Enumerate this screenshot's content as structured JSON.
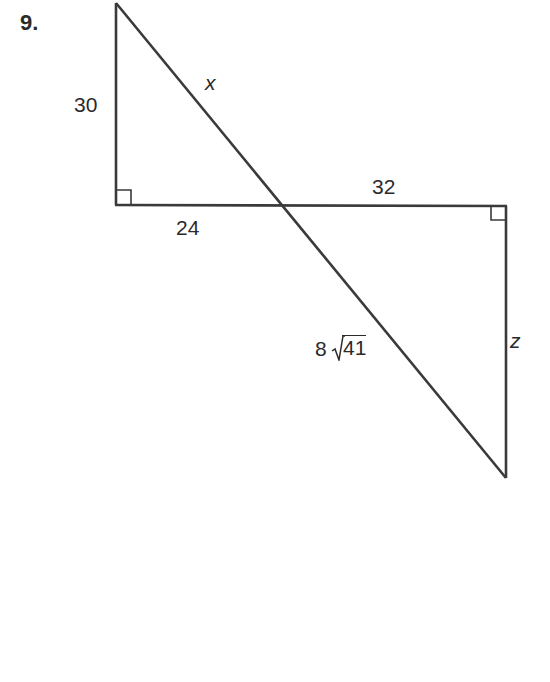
{
  "problem": {
    "number": "9."
  },
  "diagram": {
    "stroke_color": "#3a3a3a",
    "vertices": {
      "top_left": [
        116,
        3
      ],
      "left_right_angle": [
        116,
        205
      ],
      "intersection": [
        285,
        205
      ],
      "right_right_angle": [
        506,
        206
      ],
      "bottom_right": [
        506,
        478
      ]
    },
    "labels": {
      "left_leg": "30",
      "top_hypotenuse": "x",
      "left_base": "24",
      "right_base": "32",
      "bottom_hypotenuse_coef": "8",
      "bottom_hypotenuse_radicand": "41",
      "right_leg": "z"
    },
    "right_angle_markers": [
      "left_right_angle",
      "right_right_angle"
    ]
  }
}
